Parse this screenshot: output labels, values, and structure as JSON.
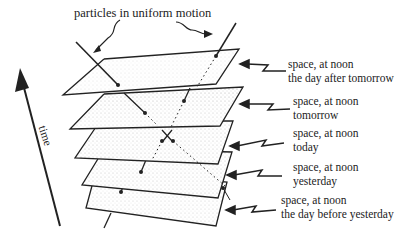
{
  "diagram": {
    "title_label": "particles in uniform motion",
    "axis_label": "time",
    "slices": [
      {
        "line1": "space, at noon",
        "line2": "the day after tomorrow"
      },
      {
        "line1": "space, at noon",
        "line2": "tomorrow"
      },
      {
        "line1": "space, at noon",
        "line2": "today"
      },
      {
        "line1": "space, at noon",
        "line2": "yesterday"
      },
      {
        "line1": "space, at noon",
        "line2": "the day before yesterday"
      }
    ],
    "colors": {
      "ink": "#222222",
      "background": "#ffffff",
      "stipple": "#9a9a9a"
    }
  }
}
